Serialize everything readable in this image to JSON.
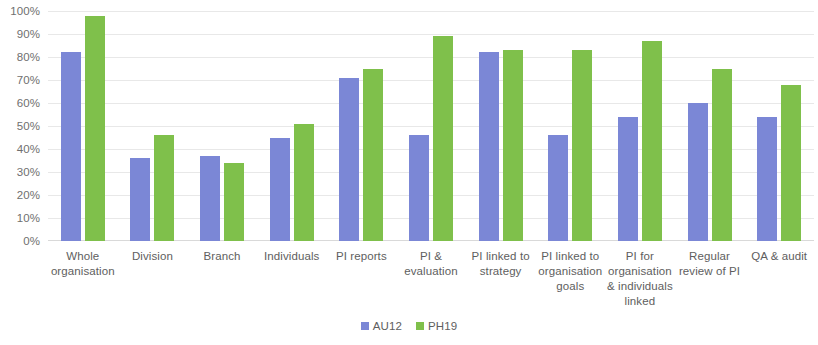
{
  "chart_data": {
    "type": "bar",
    "title": "",
    "subtitle": "",
    "xlabel": "",
    "ylabel": "",
    "ylim": [
      0,
      100
    ],
    "ytick_labels": [
      "100%",
      "90%",
      "80%",
      "70%",
      "60%",
      "50%",
      "40%",
      "30%",
      "20%",
      "10%",
      "0%"
    ],
    "ytick_values": [
      100,
      90,
      80,
      70,
      60,
      50,
      40,
      30,
      20,
      10,
      0
    ],
    "grid": true,
    "legend_position": "bottom-center",
    "categories": [
      "Whole organisation",
      "Division",
      "Branch",
      "Individuals",
      "PI reports",
      "PI & evaluation",
      "PI linked to strategy",
      "PI linked to organisation goals",
      "PI for organisation & individuals linked",
      "Regular review of PI",
      "QA & audit"
    ],
    "category_lines": [
      [
        "Whole",
        "organisation"
      ],
      [
        "Division"
      ],
      [
        "Branch"
      ],
      [
        "Individuals"
      ],
      [
        "PI reports"
      ],
      [
        "PI &",
        "evaluation"
      ],
      [
        "PI linked to",
        "strategy"
      ],
      [
        "PI linked to",
        "organisation",
        "goals"
      ],
      [
        "PI for",
        "organisation",
        "& individuals",
        "linked"
      ],
      [
        "Regular",
        "review of PI"
      ],
      [
        "QA & audit"
      ]
    ],
    "series": [
      {
        "name": "AU12",
        "color": "#7b87d6",
        "values": [
          82,
          36,
          37,
          45,
          71,
          46,
          82,
          46,
          54,
          60,
          54
        ]
      },
      {
        "name": "PH19",
        "color": "#7fc04b",
        "values": [
          98,
          46,
          34,
          51,
          75,
          89,
          83,
          83,
          87,
          75,
          68
        ]
      }
    ]
  }
}
